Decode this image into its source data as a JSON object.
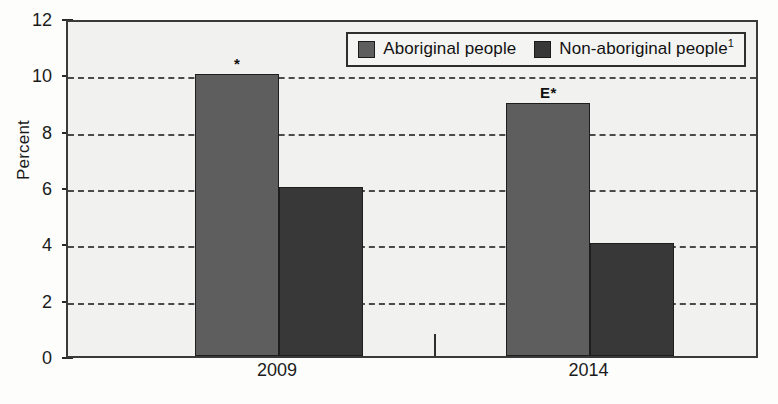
{
  "chart_data": {
    "type": "bar",
    "title": "",
    "xlabel": "",
    "ylabel": "Percent",
    "categories": [
      "2009",
      "2014"
    ],
    "series": [
      {
        "name": "Aboriginal people",
        "values": [
          10,
          9
        ],
        "color": "#5e5e5e"
      },
      {
        "name": "Non-aboriginal people",
        "values": [
          6,
          4
        ],
        "color": "#383838"
      }
    ],
    "ylim": [
      0,
      12
    ],
    "ytick_values": [
      0,
      2,
      4,
      6,
      8,
      10,
      12
    ],
    "ytick_labels": [
      "0",
      "2",
      "4",
      "6",
      "8",
      "10",
      "12"
    ],
    "grid": true,
    "gridline_values": [
      2,
      4,
      6,
      8,
      10
    ],
    "legend_position": "top-right-inside",
    "annotations": [
      {
        "category": "2009",
        "series": "Aboriginal people",
        "value": 10,
        "text": "*"
      },
      {
        "category": "2014",
        "series": "Aboriginal people",
        "value": 9,
        "text": "E*"
      }
    ],
    "legend_entries": [
      {
        "label": "Aboriginal people",
        "superscript": "",
        "color": "#5e5e5e"
      },
      {
        "label": "Non-aboriginal people",
        "superscript": "1",
        "color": "#383838"
      }
    ]
  },
  "style": {
    "plot_background": "#f1f1ef",
    "page_background": "#fdfdfb",
    "axis_color": "#3a3a3a",
    "gridline_color": "#4a4a4a"
  }
}
